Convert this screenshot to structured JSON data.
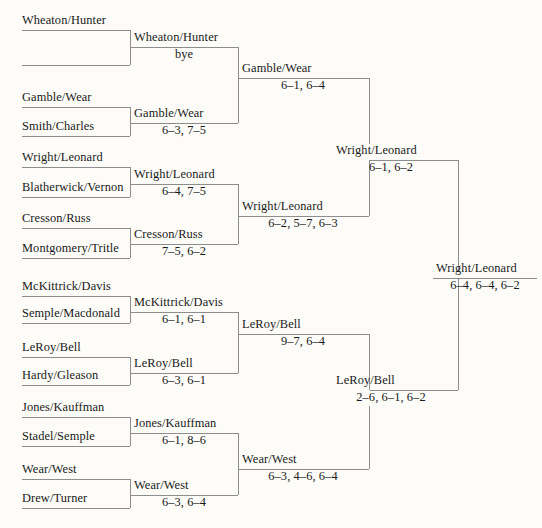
{
  "diagram": {
    "type": "single-elimination-tournament-bracket",
    "sport": "tennis-doubles",
    "rounds": 5,
    "line_color": "#8d8d8d",
    "background_color": "#fdfcf8",
    "text_color": "#1a1a1a"
  },
  "round1": {
    "label": "Round 1",
    "slots": [
      {
        "name": "Wheaton/Hunter"
      },
      {
        "name": ""
      },
      {
        "name": "Gamble/Wear"
      },
      {
        "name": "Smith/Charles"
      },
      {
        "name": "Wright/Leonard"
      },
      {
        "name": "Blatherwick/Vernon"
      },
      {
        "name": "Cresson/Russ"
      },
      {
        "name": "Montgomery/Tritle"
      },
      {
        "name": "McKittrick/Davis"
      },
      {
        "name": "Semple/Macdonald"
      },
      {
        "name": "LeRoy/Bell"
      },
      {
        "name": "Hardy/Gleason"
      },
      {
        "name": "Jones/Kauffman"
      },
      {
        "name": "Stadel/Semple"
      },
      {
        "name": "Wear/West"
      },
      {
        "name": "Drew/Turner"
      }
    ]
  },
  "round2": {
    "label": "Round 2",
    "matches": [
      {
        "winner": "Wheaton/Hunter",
        "score": "bye"
      },
      {
        "winner": "Gamble/Wear",
        "score": "6–3, 7–5"
      },
      {
        "winner": "Wright/Leonard",
        "score": "6–4, 7–5"
      },
      {
        "winner": "Cresson/Russ",
        "score": "7–5, 6–2"
      },
      {
        "winner": "McKittrick/Davis",
        "score": "6–1, 6–1"
      },
      {
        "winner": "LeRoy/Bell",
        "score": "6–3, 6–1"
      },
      {
        "winner": "Jones/Kauffman",
        "score": "6–1, 8–6"
      },
      {
        "winner": "Wear/West",
        "score": "6–3, 6–4"
      }
    ]
  },
  "quarterfinals": {
    "label": "Quarterfinals",
    "matches": [
      {
        "winner": "Gamble/Wear",
        "score": "6–1, 6–4"
      },
      {
        "winner": "Wright/Leonard",
        "score": "6–2, 5–7, 6–3"
      },
      {
        "winner": "LeRoy/Bell",
        "score": "9–7, 6–4"
      },
      {
        "winner": "Wear/West",
        "score": "6–3, 4–6, 6–4"
      }
    ]
  },
  "semifinals": {
    "label": "Semifinals",
    "matches": [
      {
        "winner": "Wright/Leonard",
        "score": "6–1, 6–2"
      },
      {
        "winner": "LeRoy/Bell",
        "score": "2–6, 6–1, 6–2"
      }
    ]
  },
  "final": {
    "label": "Final",
    "match": {
      "winner": "Wright/Leonard",
      "score": "6–4, 6–4, 6–2"
    }
  }
}
